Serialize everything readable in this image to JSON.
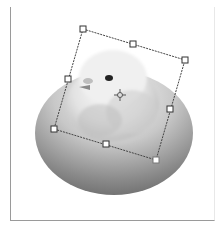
{
  "canvas": {
    "background": "#ffffff",
    "frame_color": "#9a9a9a"
  },
  "image": {
    "subject": "chick-on-egg",
    "egg_colors": {
      "light": "#f2f2f2",
      "mid": "#bdbdbd",
      "dark": "#6f6f6f"
    },
    "chick_colors": {
      "light": "#f7f7f7",
      "mid": "#d4d4d4",
      "dark": "#9a9a9a",
      "eye": "#222222",
      "beak": "#8a8a8a"
    }
  },
  "transform_box": {
    "tool": "free-transform",
    "rotation_deg": 17,
    "line_color": "#444444",
    "handles": [
      {
        "name": "top-left",
        "x": 83,
        "y": 29
      },
      {
        "name": "top-middle",
        "x": 133,
        "y": 44
      },
      {
        "name": "top-right",
        "x": 185,
        "y": 60
      },
      {
        "name": "middle-left",
        "x": 68,
        "y": 79
      },
      {
        "name": "middle-right",
        "x": 170,
        "y": 109
      },
      {
        "name": "bottom-left",
        "x": 54,
        "y": 129
      },
      {
        "name": "bottom-middle",
        "x": 106,
        "y": 144
      },
      {
        "name": "bottom-right",
        "x": 156,
        "y": 160
      }
    ],
    "reference_point": {
      "x": 120,
      "y": 95
    }
  }
}
